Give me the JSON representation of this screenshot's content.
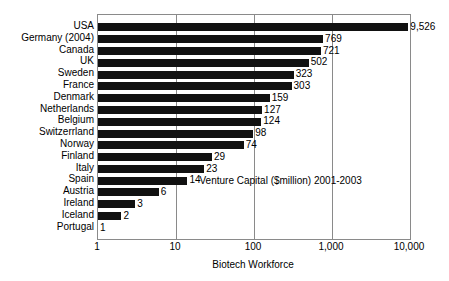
{
  "chart_data": {
    "type": "bar",
    "orientation": "horizontal",
    "title": "",
    "subtitle": "",
    "xlabel": "Biotech Workforce",
    "ylabel": "",
    "xscale": "log",
    "xlim": [
      1,
      10000
    ],
    "xticks": [
      1,
      10,
      100,
      1000,
      10000
    ],
    "xtick_labels": [
      "1",
      "10",
      "100",
      "1,000",
      "10,000"
    ],
    "grid": "vertical",
    "legend": "none",
    "bar_color": "#111111",
    "frame_color": "#8a8a8a",
    "annotations": [
      {
        "text": "Venture Capital ($million) 2001-2003",
        "x_value": 20,
        "row_index": 13
      }
    ],
    "categories": [
      "USA",
      "Germany (2004)",
      "Canada",
      "UK",
      "Sweden",
      "France",
      "Denmark",
      "Netherlands",
      "Belgium",
      "Switzerrland",
      "Norway",
      "Finland",
      "Italy",
      "Spain",
      "Austria",
      "Ireland",
      "Iceland",
      "Portugal"
    ],
    "values": [
      9526,
      769,
      721,
      502,
      323,
      303,
      159,
      127,
      124,
      98,
      74,
      29,
      23,
      14,
      6,
      3,
      2,
      1
    ],
    "value_labels": [
      "9,526",
      "769",
      "721",
      "502",
      "323",
      "303",
      "159",
      "127",
      "124",
      "98",
      "74",
      "29",
      "23",
      "14",
      "6",
      "3",
      "2",
      "1"
    ]
  }
}
